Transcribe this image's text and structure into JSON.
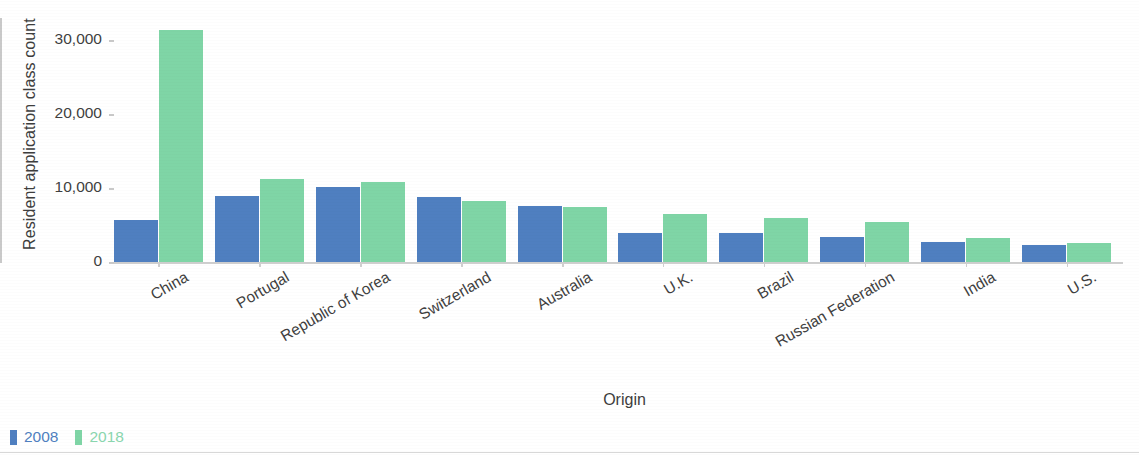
{
  "chart_data": {
    "type": "bar",
    "title": "",
    "xlabel": "Origin",
    "ylabel": "Resident application class count",
    "categories": [
      "China",
      "Portugal",
      "Republic of Korea",
      "Switzerland",
      "Australia",
      "U.K.",
      "Brazil",
      "Russian Federation",
      "India",
      "U.S."
    ],
    "series": [
      {
        "name": "2008",
        "color": "#4f7fc0",
        "values": [
          5670,
          8900,
          10150,
          8800,
          7570,
          3920,
          3900,
          3380,
          2700,
          2300
        ]
      },
      {
        "name": "2018",
        "color": "#7fd5a6",
        "values": [
          31400,
          11200,
          10800,
          8250,
          7430,
          6550,
          5950,
          5400,
          3250,
          2560
        ]
      }
    ],
    "ylim": [
      0,
      33000
    ],
    "yticks": [
      0,
      10000,
      20000,
      30000
    ],
    "ytick_labels": [
      "0",
      "10,000",
      "20,000",
      "30,000"
    ],
    "grid": false,
    "legend_position": "bottom-left",
    "xtick_rotation": -30
  },
  "legend": {
    "items": [
      {
        "label": "2008",
        "color": "#4f7fc0"
      },
      {
        "label": "2018",
        "color": "#8ad6ae"
      }
    ]
  },
  "axes": {
    "y_title": "Resident application class count",
    "x_title": "Origin"
  }
}
